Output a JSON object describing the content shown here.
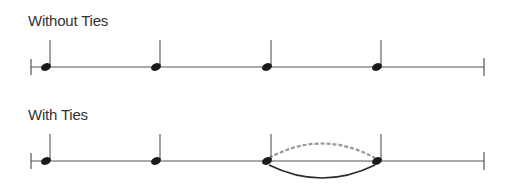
{
  "sections": [
    {
      "title": "Without Ties",
      "line_y": 67,
      "note_x": [
        46,
        156,
        267,
        377
      ],
      "tie": null
    },
    {
      "title": "With Ties",
      "line_y": 161,
      "note_x": [
        46,
        156,
        267,
        377
      ],
      "tie": {
        "from": 2,
        "to": 3
      }
    }
  ],
  "colors": {
    "line": "#555555",
    "note": "#1a1a1a",
    "tie_solid": "#2a2a2a",
    "tie_dashed": "#999999",
    "text": "#333333"
  },
  "staff": {
    "x_start": 31,
    "x_end": 484
  }
}
